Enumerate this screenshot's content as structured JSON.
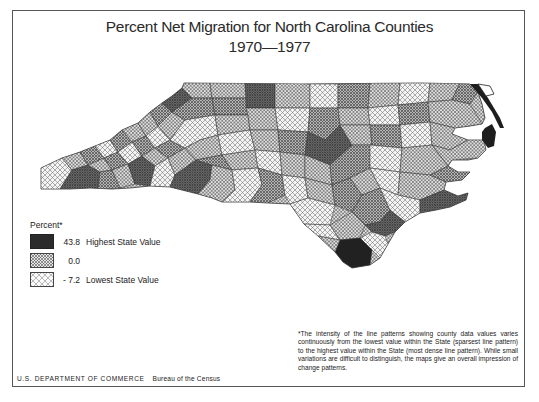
{
  "title": {
    "line1": "Percent Net Migration for North Carolina Counties",
    "line2": "1970—1977"
  },
  "legend": {
    "title": "Percent*",
    "items": [
      {
        "value": "43.8",
        "label": "Highest State Value",
        "pattern": "densest-dark"
      },
      {
        "value": "0.0",
        "label": "",
        "pattern": "medium-crosshatch"
      },
      {
        "value": "- 7.2",
        "label": "Lowest State Value",
        "pattern": "sparse-crosshatch"
      }
    ]
  },
  "footnote": "*The intensity of the line patterns showing county data values varies continuously from the lowest value within the State (sparsest line pattern) to the highest value within the State (most dense line pattern). While small variations are difficult to distinguish, the maps give an overall impression of change patterns.",
  "credit": {
    "department": "U.S. DEPARTMENT OF COMMERCE",
    "bureau": "Bureau of the Census"
  },
  "map": {
    "region": "North Carolina",
    "colors": {
      "high": "#2b2b2b",
      "mid_dark": "#7a7a7a",
      "mid": "#a9a9a9",
      "low": "#d6d6d6",
      "line": "#333333"
    }
  }
}
